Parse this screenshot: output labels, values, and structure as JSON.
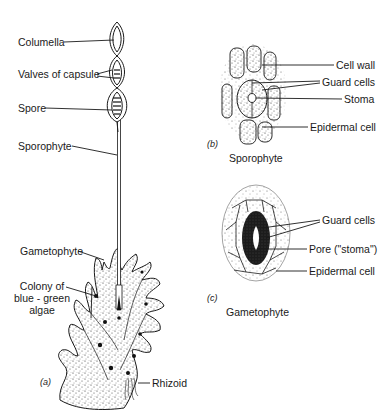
{
  "figure": {
    "panel_a": {
      "caption": "(a)",
      "labels": {
        "columella": "Columella",
        "valves": "Valves of capsule",
        "spore": "Spore",
        "sporophyte": "Sporophyte",
        "gametophyte": "Gametophyte",
        "colony_line1": "Colony of",
        "colony_line2": "blue - green",
        "colony_line3": "algae",
        "rhizoid": "Rhizoid"
      }
    },
    "panel_b": {
      "caption": "(b)",
      "subtitle": "Sporophyte",
      "labels": {
        "cell_wall": "Cell wall",
        "guard_cells": "Guard cells",
        "stoma": "Stoma",
        "epidermal_cell": "Epidermal cell"
      }
    },
    "panel_c": {
      "caption": "(c)",
      "subtitle": "Gametophyte",
      "labels": {
        "guard_cells": "Guard cells",
        "pore": "Pore (\"stoma\")",
        "epidermal_cell": "Epidermal cell"
      }
    }
  }
}
